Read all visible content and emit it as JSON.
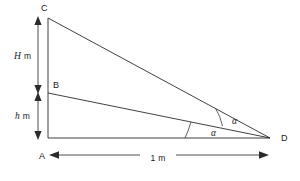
{
  "figure": {
    "background_color": "#ffffff",
    "line_color": "#2b2b2b",
    "width_px": 300,
    "height_px": 181
  },
  "points": [
    {
      "id": "A",
      "label": "A",
      "x": 48,
      "y": 138,
      "label_x": 39,
      "label_y": 159
    },
    {
      "id": "B",
      "label": "B",
      "x": 48,
      "y": 93,
      "label_x": 53,
      "label_y": 88
    },
    {
      "id": "C",
      "label": "C",
      "x": 48,
      "y": 18,
      "label_x": 41,
      "label_y": 11
    },
    {
      "id": "D",
      "label": "D",
      "x": 270,
      "y": 138,
      "label_x": 281,
      "label_y": 141
    }
  ],
  "segments": [
    {
      "id": "pole-AC",
      "from": "A",
      "to": "C"
    },
    {
      "id": "base-AD",
      "from": "A",
      "to": "D"
    },
    {
      "id": "sight-BD",
      "from": "B",
      "to": "D"
    },
    {
      "id": "sight-CD",
      "from": "C",
      "to": "D"
    }
  ],
  "dimensions": [
    {
      "id": "height-H",
      "label": "H m",
      "symbol": "H",
      "unit": "m",
      "label_x": 14,
      "label_y": 59,
      "axis": "vertical",
      "from_y": 18,
      "to_y": 92,
      "x": 38
    },
    {
      "id": "height-h",
      "label": "h m",
      "symbol": "h",
      "unit": "m",
      "label_x": 15,
      "label_y": 119,
      "axis": "vertical",
      "from_y": 94,
      "to_y": 138,
      "x": 38
    },
    {
      "id": "base-length",
      "label": "1 m",
      "symbol": "1",
      "unit": "m",
      "label_x": 158,
      "label_y": 161,
      "axis": "horizontal",
      "from_x": 50,
      "to_x": 268,
      "y": 155
    }
  ],
  "angles": [
    {
      "id": "angle-upper",
      "label": "α",
      "vertex": "D",
      "between": [
        "sight-CD",
        "sight-BD"
      ],
      "label_x": 232,
      "label_y": 124
    },
    {
      "id": "angle-lower",
      "label": "α",
      "vertex": "D",
      "between": [
        "sight-BD",
        "base-AD"
      ],
      "label_x": 211,
      "label_y": 136
    }
  ]
}
